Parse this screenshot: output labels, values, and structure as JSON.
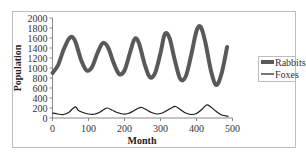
{
  "chart_data": {
    "type": "line",
    "title": "",
    "xlabel": "Month",
    "ylabel": "Population",
    "xlim": [
      0,
      500
    ],
    "ylim": [
      0,
      2000
    ],
    "x_ticks": [
      0,
      100,
      200,
      300,
      400,
      500
    ],
    "y_ticks": [
      0,
      200,
      400,
      600,
      800,
      1000,
      1200,
      1400,
      1600,
      1800,
      2000
    ],
    "grid": false,
    "legend_position": "right",
    "series": [
      {
        "name": "Rabbits",
        "color": "#595959",
        "line_width": 4,
        "x": [
          0,
          15,
          30,
          45,
          55,
          65,
          80,
          95,
          110,
          125,
          140,
          155,
          170,
          185,
          200,
          215,
          228,
          240,
          255,
          270,
          285,
          300,
          312,
          325,
          340,
          355,
          370,
          385,
          400,
          412,
          425,
          440,
          455,
          470,
          485
        ],
        "values": [
          900,
          1050,
          1350,
          1580,
          1620,
          1500,
          1150,
          950,
          1020,
          1300,
          1500,
          1400,
          1100,
          880,
          950,
          1300,
          1580,
          1500,
          1100,
          820,
          900,
          1300,
          1680,
          1600,
          1150,
          780,
          830,
          1250,
          1740,
          1820,
          1500,
          950,
          660,
          900,
          1420
        ]
      },
      {
        "name": "Foxes",
        "color": "#1a1a1a",
        "line_width": 1.2,
        "x": [
          0,
          15,
          30,
          45,
          58,
          65,
          72,
          85,
          100,
          115,
          130,
          145,
          152,
          165,
          180,
          195,
          210,
          225,
          240,
          248,
          260,
          275,
          290,
          305,
          320,
          335,
          342,
          355,
          370,
          385,
          400,
          415,
          428,
          440,
          455,
          470,
          488
        ],
        "values": [
          100,
          80,
          70,
          110,
          200,
          220,
          150,
          110,
          80,
          75,
          110,
          180,
          200,
          160,
          110,
          80,
          90,
          140,
          200,
          210,
          170,
          110,
          80,
          100,
          160,
          220,
          230,
          170,
          100,
          70,
          90,
          170,
          260,
          220,
          130,
          60,
          35
        ]
      }
    ]
  }
}
